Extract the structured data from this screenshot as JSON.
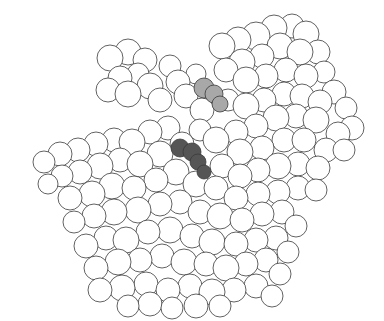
{
  "figure": {
    "type": "space-filling molecular model",
    "background": "#ffffff",
    "atom_fill": "#ffffff",
    "atom_stroke": "#3a3a3a",
    "highlight_colors": {
      "light_gray_site": "#a8a8a8",
      "dark_gray_site": "#555555"
    }
  },
  "atoms": [
    [
      110,
      58,
      13
    ],
    [
      128,
      52,
      13
    ],
    [
      145,
      60,
      12
    ],
    [
      138,
      74,
      11
    ],
    [
      120,
      78,
      12
    ],
    [
      108,
      90,
      12
    ],
    [
      128,
      94,
      13
    ],
    [
      150,
      86,
      13
    ],
    [
      160,
      100,
      12
    ],
    [
      178,
      82,
      12
    ],
    [
      170,
      66,
      11
    ],
    [
      196,
      74,
      10
    ],
    [
      186,
      96,
      12
    ],
    [
      202,
      110,
      12
    ],
    [
      222,
      46,
      13
    ],
    [
      238,
      40,
      13
    ],
    [
      256,
      36,
      14
    ],
    [
      274,
      28,
      13
    ],
    [
      292,
      26,
      12
    ],
    [
      306,
      34,
      13
    ],
    [
      318,
      52,
      12
    ],
    [
      300,
      52,
      13
    ],
    [
      280,
      46,
      13
    ],
    [
      262,
      56,
      12
    ],
    [
      242,
      62,
      13
    ],
    [
      226,
      70,
      12
    ],
    [
      246,
      80,
      13
    ],
    [
      266,
      76,
      12
    ],
    [
      286,
      70,
      12
    ],
    [
      306,
      76,
      12
    ],
    [
      324,
      72,
      11
    ],
    [
      334,
      92,
      12
    ],
    [
      320,
      102,
      12
    ],
    [
      302,
      96,
      12
    ],
    [
      284,
      94,
      12
    ],
    [
      264,
      100,
      12
    ],
    [
      246,
      106,
      13
    ],
    [
      228,
      100,
      11
    ],
    [
      346,
      108,
      11
    ],
    [
      352,
      128,
      12
    ],
    [
      338,
      134,
      12
    ],
    [
      316,
      120,
      13
    ],
    [
      296,
      116,
      12
    ],
    [
      276,
      118,
      13
    ],
    [
      256,
      126,
      12
    ],
    [
      236,
      132,
      12
    ],
    [
      216,
      140,
      13
    ],
    [
      240,
      152,
      13
    ],
    [
      262,
      148,
      12
    ],
    [
      284,
      140,
      12
    ],
    [
      304,
      140,
      12
    ],
    [
      326,
      150,
      12
    ],
    [
      344,
      150,
      11
    ],
    [
      318,
      168,
      12
    ],
    [
      298,
      164,
      12
    ],
    [
      278,
      166,
      13
    ],
    [
      258,
      170,
      12
    ],
    [
      240,
      176,
      12
    ],
    [
      222,
      166,
      12
    ],
    [
      44,
      162,
      11
    ],
    [
      60,
      154,
      12
    ],
    [
      78,
      150,
      12
    ],
    [
      96,
      144,
      12
    ],
    [
      114,
      140,
      12
    ],
    [
      132,
      142,
      13
    ],
    [
      150,
      132,
      12
    ],
    [
      168,
      128,
      12
    ],
    [
      182,
      144,
      12
    ],
    [
      200,
      130,
      11
    ],
    [
      160,
      154,
      13
    ],
    [
      140,
      164,
      13
    ],
    [
      120,
      160,
      12
    ],
    [
      100,
      166,
      13
    ],
    [
      80,
      172,
      12
    ],
    [
      62,
      176,
      11
    ],
    [
      48,
      184,
      10
    ],
    [
      70,
      198,
      12
    ],
    [
      92,
      194,
      13
    ],
    [
      112,
      186,
      13
    ],
    [
      134,
      188,
      12
    ],
    [
      156,
      180,
      12
    ],
    [
      176,
      172,
      13
    ],
    [
      196,
      184,
      13
    ],
    [
      216,
      188,
      12
    ],
    [
      236,
      198,
      12
    ],
    [
      258,
      194,
      12
    ],
    [
      278,
      192,
      12
    ],
    [
      298,
      188,
      12
    ],
    [
      316,
      190,
      11
    ],
    [
      74,
      222,
      11
    ],
    [
      94,
      216,
      12
    ],
    [
      114,
      212,
      13
    ],
    [
      138,
      210,
      13
    ],
    [
      160,
      204,
      12
    ],
    [
      180,
      202,
      12
    ],
    [
      200,
      212,
      12
    ],
    [
      220,
      216,
      13
    ],
    [
      242,
      220,
      12
    ],
    [
      262,
      214,
      12
    ],
    [
      282,
      212,
      12
    ],
    [
      296,
      226,
      11
    ],
    [
      86,
      246,
      12
    ],
    [
      106,
      238,
      12
    ],
    [
      126,
      240,
      13
    ],
    [
      148,
      232,
      12
    ],
    [
      170,
      230,
      13
    ],
    [
      192,
      236,
      12
    ],
    [
      212,
      242,
      13
    ],
    [
      236,
      244,
      12
    ],
    [
      256,
      240,
      12
    ],
    [
      276,
      238,
      12
    ],
    [
      288,
      252,
      11
    ],
    [
      96,
      268,
      12
    ],
    [
      118,
      262,
      13
    ],
    [
      140,
      260,
      12
    ],
    [
      162,
      256,
      12
    ],
    [
      184,
      262,
      13
    ],
    [
      206,
      264,
      12
    ],
    [
      226,
      268,
      13
    ],
    [
      246,
      264,
      12
    ],
    [
      266,
      260,
      12
    ],
    [
      280,
      274,
      11
    ],
    [
      100,
      290,
      12
    ],
    [
      122,
      288,
      13
    ],
    [
      146,
      284,
      12
    ],
    [
      168,
      290,
      12
    ],
    [
      190,
      286,
      12
    ],
    [
      212,
      292,
      13
    ],
    [
      234,
      290,
      12
    ],
    [
      256,
      286,
      12
    ],
    [
      272,
      296,
      11
    ],
    [
      128,
      306,
      11
    ],
    [
      150,
      304,
      12
    ],
    [
      172,
      308,
      11
    ],
    [
      196,
      306,
      12
    ],
    [
      220,
      306,
      11
    ]
  ],
  "highlight_atoms": {
    "light_gray_site": [
      [
        204,
        88,
        10
      ],
      [
        214,
        94,
        9
      ],
      [
        220,
        104,
        8
      ]
    ],
    "dark_gray_site": [
      [
        180,
        148,
        9
      ],
      [
        192,
        152,
        9
      ],
      [
        198,
        162,
        8
      ],
      [
        204,
        172,
        7
      ]
    ]
  }
}
